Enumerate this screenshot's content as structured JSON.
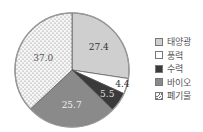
{
  "chart_data": {
    "type": "pie",
    "title": "",
    "start_angle_deg": 0,
    "direction": "clockwise",
    "categories": [
      "태양광",
      "풍력",
      "수력",
      "바이오",
      "폐기물"
    ],
    "values": [
      27.4,
      4.4,
      5.5,
      25.7,
      37.0
    ],
    "labels": [
      "27.4",
      "4.4",
      "5.5",
      "25.7",
      "37.0"
    ],
    "colors": [
      "#cfcfcf",
      "#ffffff",
      "#3a3a3a",
      "#8a8a8a",
      "#f4f4f4"
    ],
    "patterns": [
      "solid",
      "solid",
      "solid",
      "solid",
      "dots"
    ],
    "legend_position": "right"
  },
  "legend": {
    "items": [
      {
        "label": "태양광"
      },
      {
        "label": "풍력"
      },
      {
        "label": "수력"
      },
      {
        "label": "바이오"
      },
      {
        "label": "폐기물"
      }
    ]
  }
}
